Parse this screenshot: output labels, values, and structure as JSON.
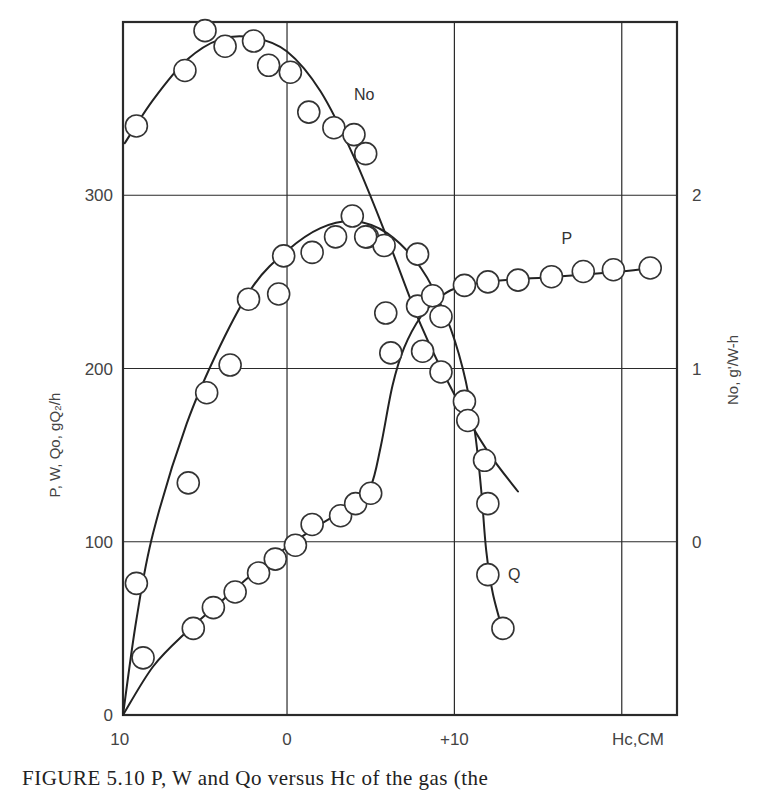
{
  "figure": {
    "caption": "FIGURE 5.10   P, W and Qo versus Hc of the gas (the"
  },
  "chart_data": {
    "type": "line",
    "title": "",
    "xlabel": "Hc,CM",
    "ylabel": "P, W, Qo, gQ₂/h",
    "y2label": "No, g'/W-h",
    "xlim": [
      -9.8,
      23.3
    ],
    "ylim": [
      0,
      400
    ],
    "y2lim": [
      -1,
      3
    ],
    "grid": true,
    "x_ticks": [
      {
        "value": -10,
        "label": "10"
      },
      {
        "value": 0,
        "label": "0"
      },
      {
        "value": 10,
        "label": "+10"
      }
    ],
    "x_gridlines": [
      0,
      10,
      20
    ],
    "y_ticks": [
      {
        "value": 0,
        "label": "0"
      },
      {
        "value": 100,
        "label": "100"
      },
      {
        "value": 200,
        "label": "200"
      },
      {
        "value": 300,
        "label": "300"
      }
    ],
    "y2_ticks": [
      {
        "value": 0,
        "label": "0"
      },
      {
        "value": 1,
        "label": "1"
      },
      {
        "value": 2,
        "label": "2"
      }
    ],
    "series": [
      {
        "name": "No",
        "axis": "right",
        "label_pos": {
          "x": 4.0,
          "y": 2.55
        },
        "points": [
          {
            "x": -9.0,
            "y": 2.4
          },
          {
            "x": -6.1,
            "y": 2.72
          },
          {
            "x": -4.9,
            "y": 2.95
          },
          {
            "x": -3.7,
            "y": 2.86
          },
          {
            "x": -2.0,
            "y": 2.89
          },
          {
            "x": -1.1,
            "y": 2.75
          },
          {
            "x": 0.2,
            "y": 2.71
          },
          {
            "x": 1.3,
            "y": 2.48
          },
          {
            "x": 2.8,
            "y": 2.39
          },
          {
            "x": 4.0,
            "y": 2.35
          },
          {
            "x": 4.7,
            "y": 2.24
          },
          {
            "x": 4.8,
            "y": 1.76
          },
          {
            "x": 5.8,
            "y": 1.71
          },
          {
            "x": 8.1,
            "y": 1.1
          },
          {
            "x": 9.2,
            "y": 0.98
          },
          {
            "x": 10.6,
            "y": 0.81
          },
          {
            "x": 10.8,
            "y": 0.7
          },
          {
            "x": 11.8,
            "y": 0.47
          }
        ],
        "curve": [
          {
            "x": -9.7,
            "y": 2.3
          },
          {
            "x": -8,
            "y": 2.55
          },
          {
            "x": -6,
            "y": 2.78
          },
          {
            "x": -4,
            "y": 2.9
          },
          {
            "x": -2,
            "y": 2.91
          },
          {
            "x": 0,
            "y": 2.83
          },
          {
            "x": 2,
            "y": 2.6
          },
          {
            "x": 4,
            "y": 2.22
          },
          {
            "x": 6,
            "y": 1.75
          },
          {
            "x": 8,
            "y": 1.25
          },
          {
            "x": 10,
            "y": 0.85
          },
          {
            "x": 12,
            "y": 0.52
          },
          {
            "x": 13.8,
            "y": 0.29
          }
        ]
      },
      {
        "name": "P",
        "axis": "left",
        "label_pos": {
          "x": 16.4,
          "y": 272
        },
        "points": [
          {
            "x": -5.6,
            "y": 50
          },
          {
            "x": -4.4,
            "y": 62
          },
          {
            "x": -3.1,
            "y": 71
          },
          {
            "x": -1.7,
            "y": 82
          },
          {
            "x": -0.7,
            "y": 90
          },
          {
            "x": 0.5,
            "y": 98
          },
          {
            "x": 1.5,
            "y": 110
          },
          {
            "x": 3.2,
            "y": 115
          },
          {
            "x": 4.1,
            "y": 122
          },
          {
            "x": 5.0,
            "y": 128
          },
          {
            "x": 6.2,
            "y": 209
          },
          {
            "x": 7.8,
            "y": 236
          },
          {
            "x": 8.7,
            "y": 242
          },
          {
            "x": 10.6,
            "y": 248
          },
          {
            "x": 12.0,
            "y": 250
          },
          {
            "x": 13.8,
            "y": 251
          },
          {
            "x": 15.8,
            "y": 253
          },
          {
            "x": 17.7,
            "y": 256
          },
          {
            "x": 19.5,
            "y": 257
          },
          {
            "x": 21.7,
            "y": 258
          }
        ],
        "curve": [
          {
            "x": -9.8,
            "y": 0
          },
          {
            "x": -8,
            "y": 28
          },
          {
            "x": -6,
            "y": 48
          },
          {
            "x": -4,
            "y": 65
          },
          {
            "x": -2,
            "y": 82
          },
          {
            "x": 0,
            "y": 97
          },
          {
            "x": 2,
            "y": 110
          },
          {
            "x": 4,
            "y": 122
          },
          {
            "x": 5,
            "y": 132
          },
          {
            "x": 5.6,
            "y": 155
          },
          {
            "x": 6.3,
            "y": 190
          },
          {
            "x": 7,
            "y": 212
          },
          {
            "x": 8,
            "y": 230
          },
          {
            "x": 9,
            "y": 240
          },
          {
            "x": 10,
            "y": 246
          },
          {
            "x": 12,
            "y": 250
          },
          {
            "x": 16,
            "y": 253
          },
          {
            "x": 20,
            "y": 256
          },
          {
            "x": 21.7,
            "y": 258
          }
        ]
      },
      {
        "name": "Q",
        "axis": "left",
        "label_pos": {
          "x": 13.2,
          "y": 78
        },
        "points": [
          {
            "x": -9.0,
            "y": 76
          },
          {
            "x": -8.6,
            "y": 33
          },
          {
            "x": -5.9,
            "y": 134
          },
          {
            "x": -4.8,
            "y": 186
          },
          {
            "x": -3.4,
            "y": 202
          },
          {
            "x": -2.3,
            "y": 240
          },
          {
            "x": -0.5,
            "y": 243
          },
          {
            "x": -0.2,
            "y": 265
          },
          {
            "x": 1.5,
            "y": 267
          },
          {
            "x": 2.9,
            "y": 276
          },
          {
            "x": 3.9,
            "y": 288
          },
          {
            "x": 4.7,
            "y": 276
          },
          {
            "x": 5.9,
            "y": 232
          },
          {
            "x": 7.8,
            "y": 266
          },
          {
            "x": 9.2,
            "y": 230
          },
          {
            "x": 12.0,
            "y": 122
          },
          {
            "x": 12.0,
            "y": 81
          },
          {
            "x": 12.9,
            "y": 50
          }
        ],
        "curve": [
          {
            "x": -9.8,
            "y": 0
          },
          {
            "x": -9,
            "y": 55
          },
          {
            "x": -8,
            "y": 105
          },
          {
            "x": -6,
            "y": 168
          },
          {
            "x": -4,
            "y": 213
          },
          {
            "x": -2,
            "y": 248
          },
          {
            "x": 0,
            "y": 268
          },
          {
            "x": 2,
            "y": 281
          },
          {
            "x": 4,
            "y": 285
          },
          {
            "x": 6,
            "y": 278
          },
          {
            "x": 8,
            "y": 258
          },
          {
            "x": 9.5,
            "y": 230
          },
          {
            "x": 10.5,
            "y": 200
          },
          {
            "x": 11.2,
            "y": 165
          },
          {
            "x": 11.6,
            "y": 130
          },
          {
            "x": 11.9,
            "y": 95
          },
          {
            "x": 12.3,
            "y": 70
          },
          {
            "x": 13.0,
            "y": 45
          }
        ]
      }
    ]
  }
}
